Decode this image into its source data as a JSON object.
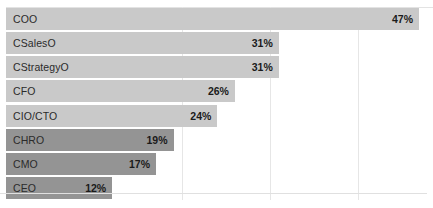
{
  "chart_data": {
    "type": "bar",
    "orientation": "horizontal",
    "title": "",
    "subtitle": "",
    "xlabel": "",
    "ylabel": "",
    "xlim": [
      0,
      48.6
    ],
    "grid": true,
    "gridlines": [
      20,
      30,
      40
    ],
    "legend": "none",
    "categories": [
      "COO",
      "CSalesO",
      "CStrategyO",
      "CFO",
      "CIO/CTO",
      "CHRO",
      "CMO",
      "CEO"
    ],
    "values": [
      47,
      31,
      31,
      26,
      24,
      19,
      17,
      12
    ],
    "value_labels": [
      "47%",
      "31%",
      "31%",
      "26%",
      "24%",
      "19%",
      "17%",
      "12%"
    ],
    "bar_colors": [
      "#c9c9c9",
      "#c9c9c9",
      "#c9c9c9",
      "#c9c9c9",
      "#c9c9c9",
      "#949494",
      "#949494",
      "#949494"
    ],
    "colors": {
      "bar_light": "#c9c9c9",
      "bar_dark": "#949494",
      "gridline": "#e6e6e6",
      "axis": "#e0e0e0",
      "label_text": "#2b2b2b",
      "value_text": "#1a1a1a",
      "background": "#ffffff"
    }
  }
}
